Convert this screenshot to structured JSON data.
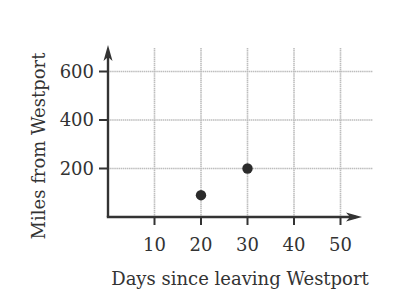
{
  "chart_data": {
    "type": "scatter",
    "title": "",
    "xlabel": "Days since leaving Westport",
    "ylabel": "Miles from Westport",
    "x_ticks": [
      10,
      20,
      30,
      40,
      50
    ],
    "y_ticks": [
      200,
      400,
      600
    ],
    "xlim": [
      0,
      55
    ],
    "ylim": [
      0,
      700
    ],
    "grid": true,
    "legend": null,
    "series": [
      {
        "name": "position",
        "points": [
          {
            "x": 20,
            "y": 90
          },
          {
            "x": 30,
            "y": 200
          }
        ]
      }
    ],
    "colors": {
      "axis": "#333333",
      "grid": "#bdbdbd",
      "point": "#2b2b2b",
      "text": "#333333"
    }
  }
}
